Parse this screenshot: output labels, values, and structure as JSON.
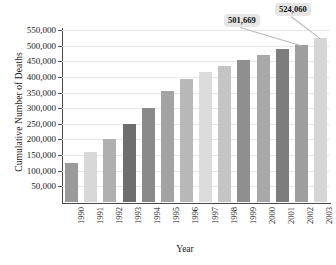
{
  "chart_data": {
    "type": "bar",
    "title": "",
    "xlabel": "Year",
    "ylabel": "Cumulative Number of Deaths",
    "grid": true,
    "legend": false,
    "ylim": [
      0,
      550000
    ],
    "ytick_labels": [
      "550,000",
      "500,000",
      "450,000",
      "400,000",
      "350,000",
      "300,000",
      "250,000",
      "200,000",
      "150,000",
      "100,000",
      "50,000"
    ],
    "ytick_values": [
      550000,
      500000,
      450000,
      400000,
      350000,
      300000,
      250000,
      200000,
      150000,
      100000,
      50000
    ],
    "categories": [
      "1990",
      "1991",
      "1992",
      "1993",
      "1994",
      "1995",
      "1996",
      "1997",
      "1998",
      "1999",
      "2000",
      "2001",
      "2002",
      "2003"
    ],
    "values": [
      124000,
      161000,
      203000,
      250000,
      301000,
      354000,
      392000,
      415000,
      435000,
      453000,
      470000,
      488000,
      501669,
      524060
    ],
    "bar_colors": [
      "#9a9a9a",
      "#d8d8d8",
      "#b0b0b0",
      "#6e6e6e",
      "#8a8a8a",
      "#a3a3a3",
      "#b8b8b8",
      "#dcdcdc",
      "#c4c4c4",
      "#8f8f8f",
      "#a8a8a8",
      "#7d7d7d",
      "#9e9e9e",
      "#d6d6d6"
    ],
    "annotations": [
      {
        "label": "501,669",
        "category": "2002",
        "value": 501669
      },
      {
        "label": "524,060",
        "category": "2003",
        "value": 524060
      }
    ]
  },
  "axes": {
    "axis_color": "#4a4a4a",
    "grid_color": "#e8e8e8",
    "background": "#ffffff"
  }
}
